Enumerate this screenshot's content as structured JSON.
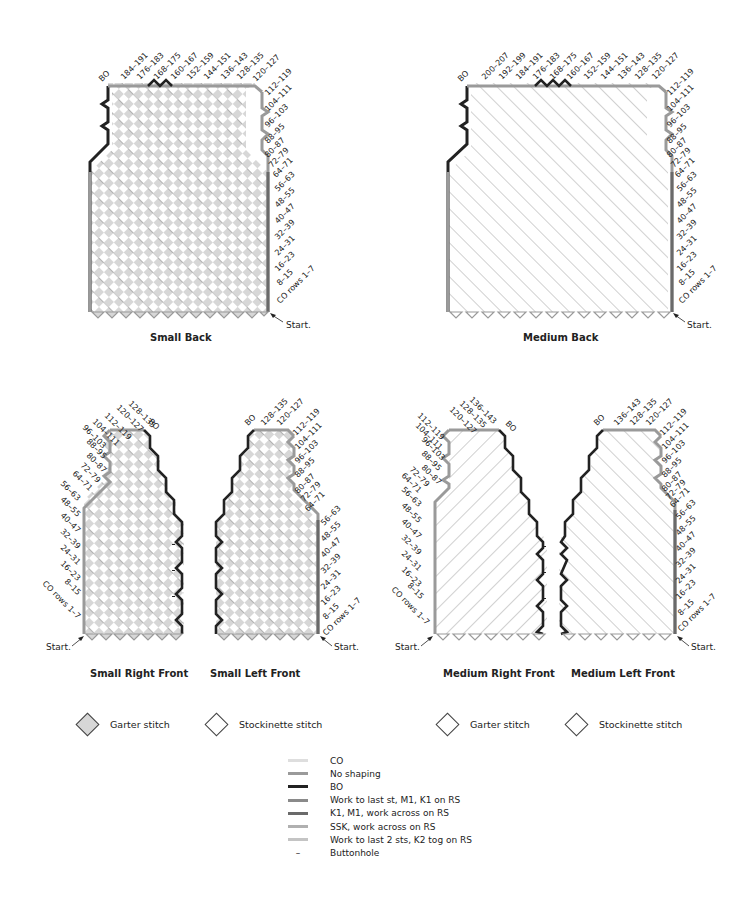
{
  "colors": {
    "garter_fill": "#d7d7d7",
    "stockinette_fill": "#ffffff",
    "co": "#dedede",
    "no_shaping": "#9a9a9a",
    "bo": "#222222",
    "inc_left": "#8a8a8a",
    "inc_right": "#6a6a6a",
    "dec_ssk": "#b0b0b0",
    "dec_k2tog": "#c4c4c4"
  },
  "diagrams": {
    "small_back": {
      "title": "Small Back",
      "start": "Start.",
      "bo_label": "BO",
      "top_labels": [
        "184–191",
        "176–183",
        "168–175",
        "160–167",
        "152–159",
        "144–151",
        "136–143",
        "128–135",
        "120–127"
      ],
      "side_labels": [
        "112–119",
        "104–111",
        "96–103",
        "88–95",
        "80–87",
        "72–79",
        "64–71",
        "56–63",
        "48–55",
        "40–47",
        "32–39",
        "24–31",
        "16–23",
        "8–15",
        "CO rows 1–7"
      ]
    },
    "medium_back": {
      "title": "Medium Back",
      "start": "Start.",
      "bo_label": "BO",
      "top_labels": [
        "200–207",
        "192–199",
        "184–191",
        "176–183",
        "168–175",
        "160–167",
        "152–159",
        "144–151",
        "136–143",
        "128–135",
        "120–127"
      ],
      "side_labels": [
        "112–119",
        "104–111",
        "96–103",
        "88–95",
        "80–87",
        "72–79",
        "64–71",
        "56–63",
        "48–55",
        "40–47",
        "32–39",
        "24–31",
        "16–23",
        "8–15",
        "CO rows 1–7"
      ]
    },
    "small_right_front": {
      "title": "Small Right Front",
      "start": "Start.",
      "bo_label": "BO",
      "top_labels": [
        "128–135",
        "120–127"
      ],
      "side_labels": [
        "112–119",
        "104–111",
        "96–103",
        "88–95",
        "80–87",
        "72–79",
        "64–71",
        "56–63",
        "48–55",
        "40–47",
        "32–39",
        "24–31",
        "16–23",
        "8–15",
        "CO rows 1–7"
      ]
    },
    "small_left_front": {
      "title": "Small Left Front",
      "start": "Start.",
      "bo_label": "BO",
      "top_labels": [
        "128–135",
        "120–127"
      ],
      "side_labels": [
        "112–119",
        "104–111",
        "96–103",
        "88–95",
        "80–87",
        "72–79",
        "64–71",
        "56–63",
        "48–55",
        "40–47",
        "32–39",
        "24–31",
        "16–23",
        "8–15",
        "CO rows 1–7"
      ]
    },
    "medium_right_front": {
      "title": "Medium Right Front",
      "start": "Start.",
      "bo_label": "BO",
      "top_labels": [
        "136–143",
        "128–135",
        "120–127"
      ],
      "side_labels": [
        "112–119",
        "104–111",
        "96–103",
        "88–95",
        "80–87",
        "72–79",
        "64–71",
        "56–63",
        "48–55",
        "40–47",
        "32–39",
        "24–31",
        "16–23",
        "8–15",
        "CO rows 1–7"
      ]
    },
    "medium_left_front": {
      "title": "Medium Left Front",
      "start": "Start.",
      "bo_label": "BO",
      "top_labels": [
        "136–143",
        "128–135",
        "120–127"
      ],
      "side_labels": [
        "112–119",
        "104–111",
        "96–103",
        "88–95",
        "80–87",
        "72–79",
        "64–71",
        "56–63",
        "48–55",
        "40–47",
        "32–39",
        "24–31",
        "16–23",
        "8–15",
        "CO rows 1–7"
      ]
    }
  },
  "stitch_keys": {
    "small": [
      {
        "label": "Garter stitch",
        "fill": "#d7d7d7"
      },
      {
        "label": "Stockinette stitch",
        "fill": "#ffffff"
      }
    ],
    "medium": [
      {
        "label": "Garter stitch",
        "fill": "#ffffff"
      },
      {
        "label": "Stockinette stitch",
        "fill": "#ffffff"
      }
    ]
  },
  "legend": [
    {
      "label": "CO",
      "color": "#dedede",
      "type": "line"
    },
    {
      "label": "No shaping",
      "color": "#9a9a9a",
      "type": "line"
    },
    {
      "label": "BO",
      "color": "#222222",
      "type": "line"
    },
    {
      "label": "Work to last st, M1, K1 on RS",
      "color": "#8a8a8a",
      "type": "line"
    },
    {
      "label": "K1, M1, work across on RS",
      "color": "#6a6a6a",
      "type": "line"
    },
    {
      "label": "SSK, work across on RS",
      "color": "#b0b0b0",
      "type": "line"
    },
    {
      "label": "Work to last 2 sts, K2 tog on RS",
      "color": "#c4c4c4",
      "type": "line"
    },
    {
      "label": "Buttonhole",
      "color": "#222222",
      "type": "dash",
      "symbol": "–"
    }
  ]
}
